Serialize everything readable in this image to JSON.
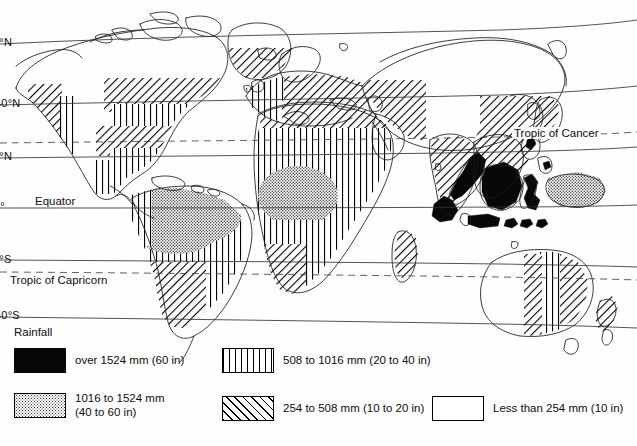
{
  "figure": {
    "projection_note": "cylindrical world map with curved latitude lines"
  },
  "latitude_labels": [
    {
      "text": "60°N",
      "clipped_text": "0°N",
      "top": 36,
      "left": -8
    },
    {
      "text": "40°N",
      "clipped_text": "40°N",
      "top": 97,
      "left": -5
    },
    {
      "text": "20°N",
      "clipped_text": "0°N",
      "top": 150,
      "left": -8
    },
    {
      "text": "0°",
      "clipped_text": "0°",
      "top": 200,
      "left": -6
    },
    {
      "text": "20°S",
      "clipped_text": "0°S",
      "top": 253,
      "left": -8
    },
    {
      "text": "40°S",
      "clipped_text": "40°S",
      "top": 309,
      "left": -5
    }
  ],
  "map_labels": {
    "equator": "Equator",
    "tropic_of_cancer": "Tropic of Cancer",
    "tropic_of_capricorn": "Tropic of Capricorn"
  },
  "legend": {
    "title": "Rainfall",
    "entries": [
      {
        "id": "over-1524",
        "pattern": "solid-black",
        "label": "over 1524 mm (60 in)"
      },
      {
        "id": "1016-1524",
        "pattern": "dots",
        "label": "1016 to 1524 mm\n(40 to 60 in)"
      },
      {
        "id": "508-1016",
        "pattern": "vertical",
        "label": "508 to 1016 mm (20 to 40 in)"
      },
      {
        "id": "254-508",
        "pattern": "diagonal",
        "label": "254 to 508 mm (10 to 20 in)"
      },
      {
        "id": "under-254",
        "pattern": "white",
        "label": "Less than 254 mm (10 in)"
      }
    ]
  },
  "colors": {
    "ink": "#000000",
    "paper": "#fefefe",
    "solid_fill": "#080808",
    "dot_fill": "#3a3a3a"
  }
}
